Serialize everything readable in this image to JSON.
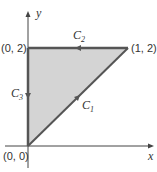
{
  "diagram": {
    "axes": {
      "x_label": "x",
      "y_label": "y"
    },
    "vertices": [
      {
        "name": "origin",
        "label": "(0, 0)",
        "x": 0,
        "y": 0
      },
      {
        "name": "top-left",
        "label": "(0, 2)",
        "x": 0,
        "y": 2
      },
      {
        "name": "top-right",
        "label": "(1, 2)",
        "x": 1,
        "y": 2
      }
    ],
    "curves": [
      {
        "name": "C1",
        "letter": "C",
        "sub": "1",
        "from": [
          0,
          0
        ],
        "to": [
          1,
          2
        ]
      },
      {
        "name": "C2",
        "letter": "C",
        "sub": "2",
        "from": [
          1,
          2
        ],
        "to": [
          0,
          2
        ]
      },
      {
        "name": "C3",
        "letter": "C",
        "sub": "3",
        "from": [
          0,
          2
        ],
        "to": [
          0,
          0
        ]
      }
    ],
    "colors": {
      "fill": "#d4d4d4",
      "edge": "#555555",
      "axis": "#444444"
    }
  }
}
